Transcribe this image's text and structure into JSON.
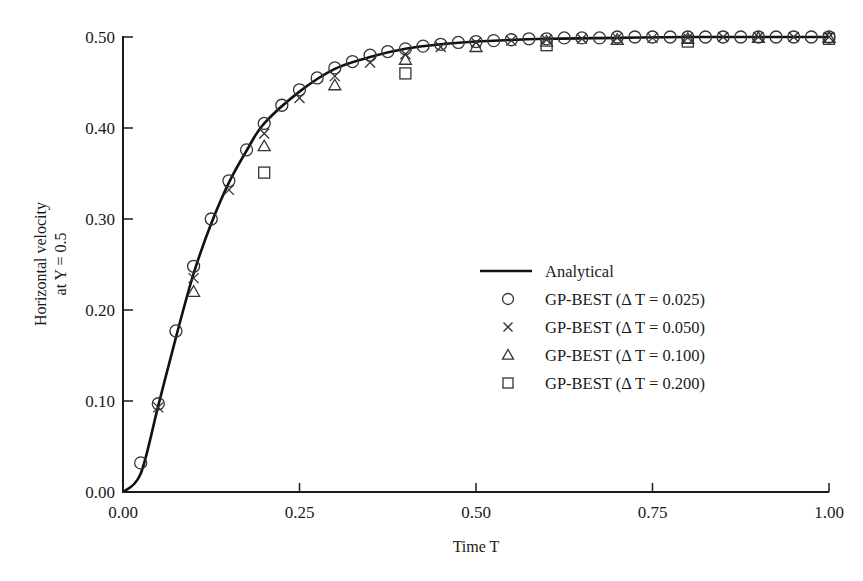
{
  "chart_data": {
    "type": "line",
    "title": "",
    "xlabel": "Time T",
    "ylabel_line1": "Horizontal velocity",
    "ylabel_line2": "at Y = 0.5",
    "xlim": [
      0,
      1
    ],
    "ylim": [
      0,
      0.5
    ],
    "grid": false,
    "legend_position": "center-right",
    "x_ticks": [
      "0.00",
      "0.25",
      "0.50",
      "0.75",
      "1.00"
    ],
    "y_ticks": [
      "0.00",
      "0.10",
      "0.20",
      "0.30",
      "0.40",
      "0.50"
    ],
    "x_tick_values": [
      0,
      0.25,
      0.5,
      0.75,
      1.0
    ],
    "y_tick_values": [
      0,
      0.1,
      0.2,
      0.3,
      0.4,
      0.5
    ],
    "series": [
      {
        "name": "Analytical",
        "marker": "line",
        "x": [
          0,
          0.025,
          0.05,
          0.075,
          0.1,
          0.125,
          0.15,
          0.175,
          0.2,
          0.25,
          0.3,
          0.35,
          0.4,
          0.45,
          0.5,
          0.6,
          0.7,
          0.8,
          0.9,
          1.0
        ],
        "values": [
          0,
          0.02,
          0.095,
          0.17,
          0.24,
          0.295,
          0.34,
          0.375,
          0.405,
          0.44,
          0.465,
          0.478,
          0.487,
          0.492,
          0.495,
          0.498,
          0.499,
          0.5,
          0.5,
          0.5
        ]
      },
      {
        "name": "GP-BEST (Δ T = 0.025)",
        "marker": "circle",
        "x": [
          0.025,
          0.05,
          0.075,
          0.1,
          0.125,
          0.15,
          0.175,
          0.2,
          0.225,
          0.25,
          0.275,
          0.3,
          0.325,
          0.35,
          0.375,
          0.4,
          0.425,
          0.45,
          0.475,
          0.5,
          0.525,
          0.55,
          0.575,
          0.6,
          0.625,
          0.65,
          0.675,
          0.7,
          0.725,
          0.75,
          0.775,
          0.8,
          0.825,
          0.85,
          0.875,
          0.9,
          0.925,
          0.95,
          0.975,
          1.0
        ],
        "values": [
          0.032,
          0.097,
          0.177,
          0.248,
          0.3,
          0.342,
          0.376,
          0.405,
          0.425,
          0.442,
          0.455,
          0.466,
          0.473,
          0.48,
          0.484,
          0.487,
          0.49,
          0.492,
          0.494,
          0.495,
          0.496,
          0.497,
          0.498,
          0.498,
          0.499,
          0.499,
          0.499,
          0.5,
          0.5,
          0.5,
          0.5,
          0.5,
          0.5,
          0.5,
          0.5,
          0.5,
          0.5,
          0.5,
          0.5,
          0.5
        ]
      },
      {
        "name": "GP-BEST (Δ T = 0.050)",
        "marker": "x",
        "x": [
          0.05,
          0.1,
          0.15,
          0.2,
          0.25,
          0.3,
          0.35,
          0.4,
          0.45,
          0.5,
          0.55,
          0.6,
          0.65,
          0.7,
          0.75,
          0.8,
          0.85,
          0.9,
          0.95,
          1.0
        ],
        "values": [
          0.093,
          0.235,
          0.332,
          0.394,
          0.433,
          0.457,
          0.472,
          0.481,
          0.489,
          0.494,
          0.496,
          0.497,
          0.498,
          0.499,
          0.499,
          0.499,
          0.5,
          0.5,
          0.5,
          0.5
        ]
      },
      {
        "name": "GP-BEST (Δ T = 0.100)",
        "marker": "triangle",
        "x": [
          0.1,
          0.2,
          0.3,
          0.4,
          0.5,
          0.6,
          0.7,
          0.8,
          0.9,
          1.0
        ],
        "values": [
          0.22,
          0.38,
          0.447,
          0.475,
          0.489,
          0.495,
          0.497,
          0.498,
          0.499,
          0.499
        ]
      },
      {
        "name": "GP-BEST (Δ T = 0.200)",
        "marker": "square",
        "x": [
          0.2,
          0.4,
          0.6,
          0.8,
          1.0
        ],
        "values": [
          0.351,
          0.46,
          0.491,
          0.495,
          0.498
        ]
      }
    ]
  },
  "legend": {
    "items": [
      {
        "label": "Analytical",
        "marker": "line"
      },
      {
        "label": "GP-BEST (Δ T = 0.025)",
        "marker": "circle"
      },
      {
        "label": "GP-BEST (Δ T = 0.050)",
        "marker": "x"
      },
      {
        "label": "GP-BEST (Δ T = 0.100)",
        "marker": "triangle"
      },
      {
        "label": "GP-BEST (Δ T = 0.200)",
        "marker": "square"
      }
    ]
  },
  "colors": {
    "curve": "#111111",
    "marker": "#333333",
    "axis": "#1a1a1a",
    "background": "#ffffff"
  }
}
